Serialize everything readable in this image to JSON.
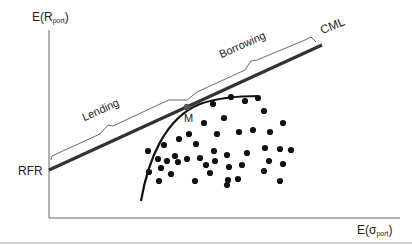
{
  "diagram": {
    "y_axis": {
      "label_main": "E(R",
      "label_sub": "port",
      "label_close": ")"
    },
    "x_axis": {
      "label_main": "E(σ",
      "label_sub": "port",
      "label_close": ")"
    },
    "labels": {
      "rfr": "RFR",
      "cml": "CML",
      "market_portfolio": "M",
      "lending": "Lending",
      "borrowing": "Borrowing"
    },
    "colors": {
      "axis": "#555555",
      "cml_line": "#333333",
      "frontier_curve": "#111111",
      "dots": "#111111",
      "bracket": "#444444",
      "m_point": "#555555"
    },
    "geometry": {
      "origin": [
        49,
        218
      ],
      "y_axis_top": [
        49,
        30
      ],
      "x_axis_end": [
        400,
        218
      ],
      "cml_start": [
        49,
        170
      ],
      "cml_end": [
        322,
        45
      ],
      "m_point": [
        187,
        107
      ],
      "portfolio_dots": [
        [
          213,
          104
        ],
        [
          231,
          97
        ],
        [
          245,
          101
        ],
        [
          258,
          98
        ],
        [
          224,
          118
        ],
        [
          264,
          111
        ],
        [
          204,
          123
        ],
        [
          217,
          134
        ],
        [
          239,
          132
        ],
        [
          253,
          130
        ],
        [
          270,
          132
        ],
        [
          283,
          123
        ],
        [
          179,
          139
        ],
        [
          189,
          134
        ],
        [
          164,
          145
        ],
        [
          148,
          151
        ],
        [
          175,
          156
        ],
        [
          196,
          144
        ],
        [
          214,
          151
        ],
        [
          227,
          155
        ],
        [
          247,
          153
        ],
        [
          265,
          148
        ],
        [
          280,
          149
        ],
        [
          291,
          150
        ],
        [
          158,
          159
        ],
        [
          167,
          161
        ],
        [
          187,
          159
        ],
        [
          200,
          158
        ],
        [
          161,
          168
        ],
        [
          178,
          162
        ],
        [
          206,
          165
        ],
        [
          215,
          161
        ],
        [
          229,
          167
        ],
        [
          242,
          165
        ],
        [
          269,
          161
        ],
        [
          283,
          164
        ],
        [
          149,
          172
        ],
        [
          171,
          174
        ],
        [
          210,
          173
        ],
        [
          228,
          180
        ],
        [
          238,
          179
        ],
        [
          159,
          181
        ],
        [
          195,
          181
        ],
        [
          227,
          185
        ],
        [
          264,
          171
        ],
        [
          280,
          181
        ]
      ]
    }
  }
}
